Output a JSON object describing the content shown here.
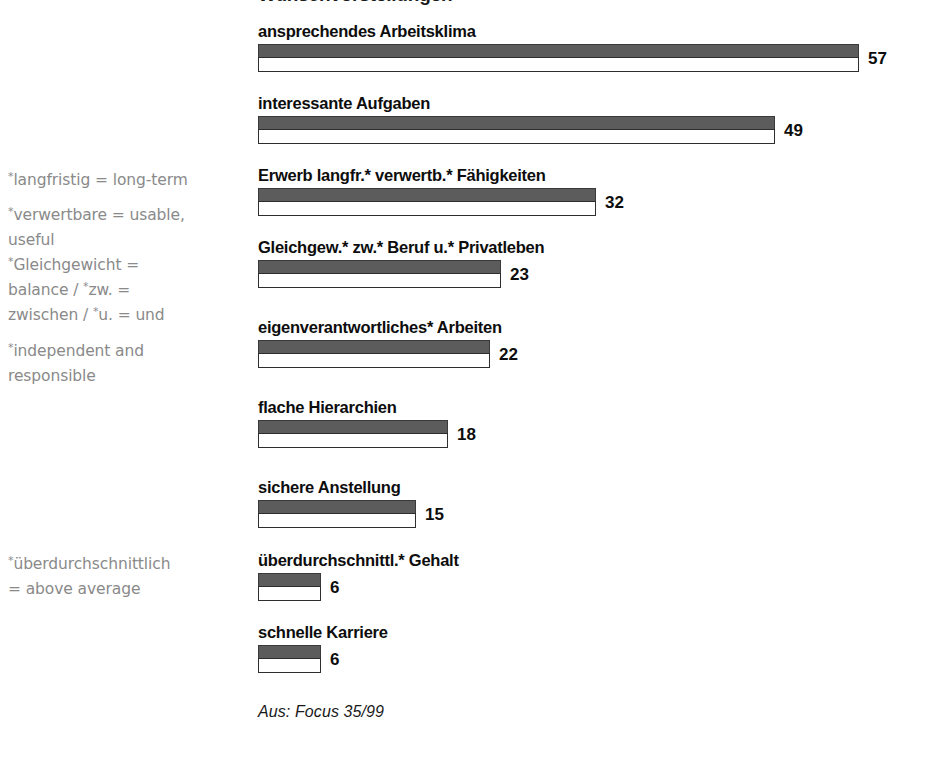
{
  "title_partial": "Wunschvorstellungen",
  "source_caption": "Aus: Focus 35/99",
  "colors": {
    "bar_fill": "#5c5c5c",
    "bar_outline": "#2e2e2e",
    "label_text": "#0d0d0d",
    "annotation_text": "#8a8a8a",
    "background": "#ffffff"
  },
  "annotations": [
    {
      "id": "annot-langfristig",
      "top": 168,
      "lines": [
        {
          "star": true,
          "text": "langfristig = long-term"
        }
      ]
    },
    {
      "id": "annot-verwertbare",
      "top": 203,
      "lines": [
        {
          "star": true,
          "text": "verwertbare = usable,"
        },
        {
          "star": false,
          "text": "useful"
        }
      ]
    },
    {
      "id": "annot-gleichgewicht",
      "top": 253,
      "lines": [
        {
          "star": true,
          "text": "Gleichgewicht ="
        },
        {
          "star": false,
          "text": "balance / *zw. ="
        },
        {
          "star": false,
          "text": "zwischen / *u. = und"
        }
      ]
    },
    {
      "id": "annot-independent",
      "top": 339,
      "lines": [
        {
          "star": true,
          "text": "independent and"
        },
        {
          "star": false,
          "text": "responsible"
        }
      ]
    },
    {
      "id": "annot-ueberdurchschnittlich",
      "top": 552,
      "lines": [
        {
          "star": true,
          "text": "überdurchschnittlich"
        },
        {
          "star": false,
          "text": "= above average"
        }
      ]
    }
  ],
  "chart_data": {
    "type": "bar",
    "title": "Wunschvorstellungen",
    "orientation": "horizontal",
    "xlabel": "",
    "ylabel": "",
    "xlim": [
      0,
      60
    ],
    "grid": false,
    "legend": "none",
    "value_suffix": "",
    "categories": [
      "ansprechendes Arbeitsklima",
      "interessante Aufgaben",
      "Erwerb langfr.* verwertb.*  Fähigkeiten",
      "Gleichgew.* zw.* Beruf u.* Privatleben",
      "eigenverantwortliches* Arbeiten",
      "flache Hierarchien",
      "sichere Anstellung",
      "überdurchschnittl.* Gehalt",
      "schnelle Karriere"
    ],
    "values": [
      57,
      49,
      32,
      23,
      22,
      18,
      15,
      6,
      6
    ],
    "bars": [
      {
        "label": "ansprechendes Arbeitsklima",
        "value": 57,
        "top": 22
      },
      {
        "label": "interessante Aufgaben",
        "value": 49,
        "top": 94
      },
      {
        "label": "Erwerb langfr.* verwertb.*  Fähigkeiten",
        "value": 32,
        "top": 166
      },
      {
        "label": "Gleichgew.* zw.* Beruf u.* Privatleben",
        "value": 23,
        "top": 238
      },
      {
        "label": "eigenverantwortliches* Arbeiten",
        "value": 22,
        "top": 318
      },
      {
        "label": "flache Hierarchien",
        "value": 18,
        "top": 398
      },
      {
        "label": "sichere Anstellung",
        "value": 15,
        "top": 478
      },
      {
        "label": "überdurchschnittl.* Gehalt",
        "value": 6,
        "top": 551
      },
      {
        "label": "schnelle Karriere",
        "value": 6,
        "top": 623
      }
    ],
    "px_per_unit": 10.55
  }
}
